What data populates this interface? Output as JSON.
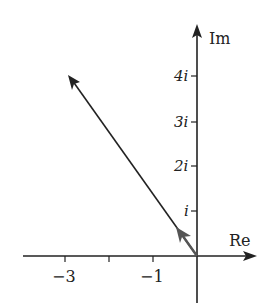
{
  "diagram": {
    "type": "complex-plane",
    "axes": {
      "x_label": "Re",
      "y_label": "Im",
      "x_ticks": [
        {
          "value": -3,
          "label": "−3"
        },
        {
          "value": -2,
          "label": ""
        },
        {
          "value": -1,
          "label": "−1"
        }
      ],
      "y_ticks": [
        {
          "value": 1,
          "label": "i"
        },
        {
          "value": 2,
          "label": "2i"
        },
        {
          "value": 3,
          "label": "3i"
        },
        {
          "value": 4,
          "label": "4i"
        }
      ]
    },
    "vectors": [
      {
        "name": "z",
        "from": [
          0,
          0
        ],
        "to": [
          -3,
          4
        ]
      },
      {
        "name": "unit-z",
        "from": [
          0,
          0
        ],
        "to": [
          -0.6,
          0.8
        ]
      }
    ],
    "colors": {
      "ink": "#222222",
      "unit_vector": "#555555"
    }
  }
}
